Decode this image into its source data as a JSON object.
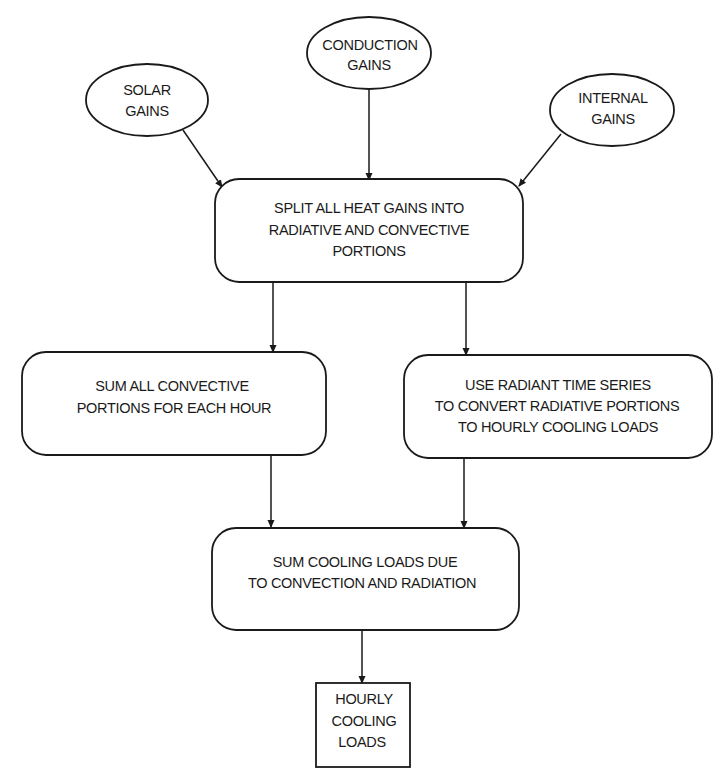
{
  "diagram": {
    "type": "flowchart",
    "nodes": {
      "solar": {
        "shape": "ellipse",
        "lines": [
          "SOLAR",
          "GAINS"
        ]
      },
      "conduction": {
        "shape": "ellipse",
        "lines": [
          "CONDUCTION",
          "GAINS"
        ]
      },
      "internal": {
        "shape": "ellipse",
        "lines": [
          "INTERNAL",
          "GAINS"
        ]
      },
      "split": {
        "shape": "rounded-rect",
        "lines": [
          "SPLIT ALL HEAT GAINS INTO",
          "RADIATIVE AND CONVECTIVE",
          "PORTIONS"
        ]
      },
      "convective": {
        "shape": "rounded-rect",
        "lines": [
          "SUM ALL CONVECTIVE",
          "PORTIONS FOR EACH HOUR"
        ]
      },
      "radiant": {
        "shape": "rounded-rect",
        "lines": [
          "USE RADIANT TIME SERIES",
          "TO CONVERT RADIATIVE PORTIONS",
          "TO HOURLY COOLING LOADS"
        ]
      },
      "sum": {
        "shape": "rounded-rect",
        "lines": [
          "SUM COOLING LOADS DUE",
          "TO CONVECTION AND RADIATION"
        ]
      },
      "output": {
        "shape": "rect",
        "lines": [
          "HOURLY",
          "COOLING",
          "LOADS"
        ]
      }
    },
    "edges": [
      {
        "from": "solar",
        "to": "split"
      },
      {
        "from": "conduction",
        "to": "split"
      },
      {
        "from": "internal",
        "to": "split"
      },
      {
        "from": "split",
        "to": "convective"
      },
      {
        "from": "split",
        "to": "radiant"
      },
      {
        "from": "convective",
        "to": "sum"
      },
      {
        "from": "radiant",
        "to": "sum"
      },
      {
        "from": "sum",
        "to": "output"
      }
    ],
    "colors": {
      "stroke": "#1a1a1a",
      "background": "#ffffff",
      "text": "#1a1a1a"
    }
  }
}
